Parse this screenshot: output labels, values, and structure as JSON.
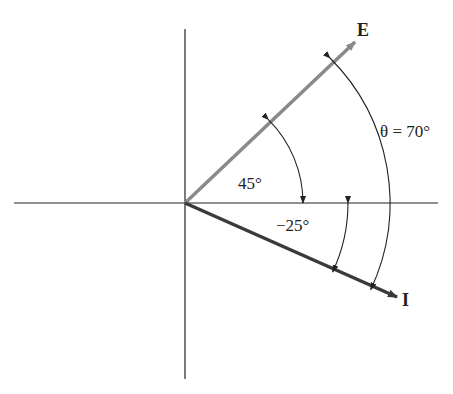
{
  "diagram": {
    "type": "phasor-diagram",
    "origin": {
      "x": 185,
      "y": 203
    },
    "axes": {
      "horizontal": {
        "x1": 14,
        "x2": 438
      },
      "vertical": {
        "y1": 29,
        "y2": 379
      },
      "color": "#222222"
    },
    "phasors": [
      {
        "name": "E",
        "label": "E",
        "angle_deg": 45,
        "color": "#8a8a8a",
        "tip": {
          "x": 355,
          "y": 42
        }
      },
      {
        "name": "I",
        "label": "I",
        "angle_deg": -25,
        "color": "#3a3a3a",
        "tip": {
          "x": 397,
          "y": 297
        }
      }
    ],
    "angle_labels": {
      "e_angle": "45°",
      "i_angle": "−25°",
      "theta": "θ = 70°"
    }
  }
}
